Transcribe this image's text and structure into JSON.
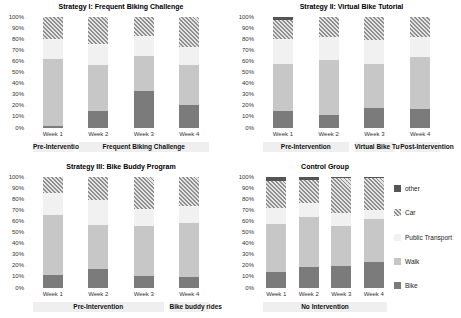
{
  "window": {
    "background": "#ffffff"
  },
  "colors": {
    "bike": "#7b7b7b",
    "walk": "#c7c7c7",
    "public_transport": "#f1f1f1",
    "car_stripe": "#8f8f8f",
    "car_bg": "#e4e4e4",
    "other": "#555555",
    "section_band": "#efefef",
    "tick_text": "#333333",
    "title_text": "#000000"
  },
  "y_ticks": [
    "100%",
    "90%",
    "80%",
    "70%",
    "60%",
    "50%",
    "40%",
    "30%",
    "20%",
    "10%",
    "0%"
  ],
  "legend": {
    "items": [
      {
        "label": "other",
        "key": "other"
      },
      {
        "label": "Car",
        "key": "car"
      },
      {
        "label": "Public Transport",
        "key": "public_transport"
      },
      {
        "label": "Walk",
        "key": "walk"
      },
      {
        "label": "Bike",
        "key": "bike"
      }
    ]
  },
  "chart_data": [
    {
      "type": "bar",
      "stacked": true,
      "title": "Strategy I: Frequent Biking Challenge",
      "categories": [
        "Week 1",
        "Week 2",
        "Week 3",
        "Week 4"
      ],
      "ylim": [
        0,
        100
      ],
      "grid": false,
      "series": [
        {
          "name": "Bike",
          "key": "bike",
          "values": [
            2,
            15,
            33,
            21
          ]
        },
        {
          "name": "Walk",
          "key": "walk",
          "values": [
            60,
            42,
            32,
            36
          ]
        },
        {
          "name": "Public Transport",
          "key": "public_transport",
          "values": [
            18,
            19,
            18,
            16
          ]
        },
        {
          "name": "Car",
          "key": "car",
          "values": [
            20,
            24,
            17,
            27
          ]
        },
        {
          "name": "other",
          "key": "other",
          "values": [
            0,
            0,
            0,
            0
          ]
        }
      ],
      "sections": [
        {
          "label": "Pre-Intervention",
          "start": 0,
          "end": 0
        },
        {
          "label": "Frequent Biking Challenge",
          "start": 1,
          "end": 3
        }
      ]
    },
    {
      "type": "bar",
      "stacked": true,
      "title": "Strategy II: Virtual Bike Tutorial",
      "categories": [
        "Week 1",
        "Week 2",
        "Week 3",
        "Week 4"
      ],
      "ylim": [
        0,
        100
      ],
      "grid": false,
      "series": [
        {
          "name": "Bike",
          "key": "bike",
          "values": [
            15,
            12,
            18,
            17
          ]
        },
        {
          "name": "Walk",
          "key": "walk",
          "values": [
            43,
            49,
            40,
            47
          ]
        },
        {
          "name": "Public Transport",
          "key": "public_transport",
          "values": [
            22,
            21,
            21,
            18
          ]
        },
        {
          "name": "Car",
          "key": "car",
          "values": [
            17,
            18,
            21,
            18
          ]
        },
        {
          "name": "other",
          "key": "other",
          "values": [
            3,
            0,
            0,
            0
          ]
        }
      ],
      "sections": [
        {
          "label": "Pre-Intervention",
          "start": 0,
          "end": 1
        },
        {
          "label": "Virtual Bike Tutorial",
          "start": 2,
          "end": 2
        },
        {
          "label": "Post-Intervention",
          "start": 3,
          "end": 3
        }
      ]
    },
    {
      "type": "bar",
      "stacked": true,
      "title": "Strategy III: Bike Buddy Program",
      "categories": [
        "Week 1",
        "Week 2",
        "Week 3",
        "Week 4"
      ],
      "ylim": [
        0,
        100
      ],
      "grid": false,
      "series": [
        {
          "name": "Bike",
          "key": "bike",
          "values": [
            12,
            17,
            11,
            10
          ]
        },
        {
          "name": "Walk",
          "key": "walk",
          "values": [
            54,
            40,
            45,
            49
          ]
        },
        {
          "name": "Public Transport",
          "key": "public_transport",
          "values": [
            20,
            22,
            15,
            15
          ]
        },
        {
          "name": "Car",
          "key": "car",
          "values": [
            14,
            21,
            29,
            26
          ]
        },
        {
          "name": "other",
          "key": "other",
          "values": [
            0,
            0,
            0,
            0
          ]
        }
      ],
      "sections": [
        {
          "label": "Pre-Intervention",
          "start": 0,
          "end": 2
        },
        {
          "label": "Bike buddy rides",
          "start": 3,
          "end": 3
        }
      ]
    },
    {
      "type": "bar",
      "stacked": true,
      "title": "Control Group",
      "categories": [
        "Week 1",
        "Week 2",
        "Week 3",
        "Week 4"
      ],
      "ylim": [
        0,
        100
      ],
      "grid": false,
      "legend_position": "right",
      "series": [
        {
          "name": "Bike",
          "key": "bike",
          "values": [
            14,
            19,
            20,
            23
          ]
        },
        {
          "name": "Walk",
          "key": "walk",
          "values": [
            44,
            45,
            36,
            39
          ]
        },
        {
          "name": "Public Transport",
          "key": "public_transport",
          "values": [
            14,
            13,
            12,
            8
          ]
        },
        {
          "name": "Car",
          "key": "car",
          "values": [
            24,
            20,
            31,
            29
          ]
        },
        {
          "name": "other",
          "key": "other",
          "values": [
            4,
            3,
            1,
            1
          ]
        }
      ],
      "sections": [
        {
          "label": "No Intervention",
          "start": 0,
          "end": 3
        }
      ]
    }
  ]
}
